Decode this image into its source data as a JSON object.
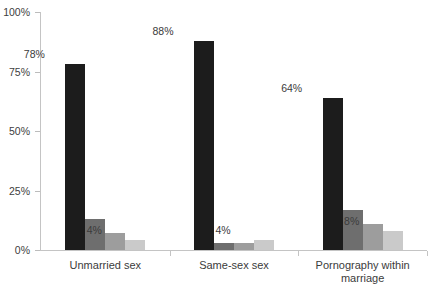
{
  "chart_data": {
    "type": "bar",
    "title": "",
    "subtitle": "",
    "xlabel": "",
    "ylabel": "",
    "ylim": [
      0,
      100
    ],
    "grid": false,
    "legend_position": "none",
    "categories": [
      "Unmarried sex",
      "Same-sex sex",
      "Pornography within\nmarriage"
    ],
    "y_ticks": [
      "0%",
      "25%",
      "50%",
      "75%",
      "100%"
    ],
    "y_tick_values": [
      0,
      25,
      50,
      75,
      100
    ],
    "series": [
      {
        "name": "series-1",
        "color": "#1c1c1c",
        "values": [
          78,
          88,
          64
        ],
        "labels": [
          "78%",
          "88%",
          "64%"
        ]
      },
      {
        "name": "series-2",
        "color": "#6e6e6e",
        "values": [
          13,
          3,
          17
        ],
        "labels": [
          "",
          "",
          ""
        ]
      },
      {
        "name": "series-3",
        "color": "#9d9d9d",
        "values": [
          7,
          3,
          11
        ],
        "labels": [
          "",
          "",
          ""
        ]
      },
      {
        "name": "series-4",
        "color": "#cacaca",
        "values": [
          4,
          4,
          8
        ],
        "labels": [
          "4%",
          "4%",
          "8%"
        ]
      }
    ]
  },
  "axis": {
    "line_color": "#c4c4c4",
    "tick_color": "#bcbcbc",
    "text_color": "#3b3b3b"
  }
}
